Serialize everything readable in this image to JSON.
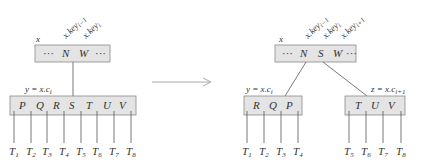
{
  "before": {
    "node_label": "x",
    "pointer_labels": [
      "x.key_{i-1}",
      "x.key_i"
    ],
    "pointer_label_parts": [
      {
        "base": "x.key",
        "sub": "i−1"
      },
      {
        "base": "x.key",
        "sub": "i"
      }
    ],
    "parent_keys": [
      "···",
      "N",
      "W",
      "···"
    ],
    "child_label": {
      "base": "y = x.c",
      "sub": "i"
    },
    "child_keys": [
      "P",
      "Q",
      "R",
      "S",
      "T",
      "U",
      "V"
    ],
    "subtrees": [
      {
        "base": "T",
        "sub": "1"
      },
      {
        "base": "T",
        "sub": "2"
      },
      {
        "base": "T",
        "sub": "3"
      },
      {
        "base": "T",
        "sub": "4"
      },
      {
        "base": "T",
        "sub": "5"
      },
      {
        "base": "T",
        "sub": "6"
      },
      {
        "base": "T",
        "sub": "7"
      },
      {
        "base": "T",
        "sub": "8"
      }
    ]
  },
  "after": {
    "node_label": "x",
    "pointer_label_parts": [
      {
        "base": "x.key",
        "sub": "i−1"
      },
      {
        "base": "x.key",
        "sub": "i"
      },
      {
        "base": "x.key",
        "sub": "i+1"
      }
    ],
    "parent_keys": [
      "···",
      "N",
      "S",
      "W",
      "···"
    ],
    "left_child_label": {
      "base": "y = x.c",
      "sub": "i"
    },
    "left_child_keys": [
      "R",
      "Q",
      "P"
    ],
    "left_subtrees": [
      {
        "base": "T",
        "sub": "1"
      },
      {
        "base": "T",
        "sub": "2"
      },
      {
        "base": "T",
        "sub": "3"
      },
      {
        "base": "T",
        "sub": "4"
      }
    ],
    "right_child_label": {
      "base": "z = x.c",
      "sub": "i+1"
    },
    "right_child_keys": [
      "T",
      "U",
      "V"
    ],
    "right_subtrees": [
      {
        "base": "T",
        "sub": "5"
      },
      {
        "base": "T",
        "sub": "6"
      },
      {
        "base": "T",
        "sub": "7"
      },
      {
        "base": "T",
        "sub": "8"
      }
    ]
  },
  "colors": {
    "node_fill": "#e4e4e4",
    "node_stroke": "#8a8a8a",
    "arrow": "#aaaaaa"
  }
}
